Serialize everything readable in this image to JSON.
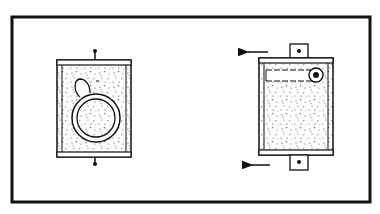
{
  "diagram": {
    "type": "technical-illustration",
    "colors": {
      "ink": "#111111",
      "paper": "#ffffff",
      "stipple": "#333333"
    },
    "frame": {
      "x": 12,
      "y": 17,
      "w": 358,
      "h": 185,
      "stroke": 3
    },
    "left_view": {
      "label": "",
      "body": {
        "x": 57,
        "y": 60,
        "w": 74,
        "h": 97
      },
      "rail_top": {
        "y": 60,
        "h": 5
      },
      "rail_bottom": {
        "y": 152,
        "h": 5
      },
      "pin_top": {
        "cx": 95,
        "cy": 51
      },
      "pin_bottom": {
        "cx": 95,
        "cy": 164
      },
      "dial": {
        "cx": 96,
        "cy": 118,
        "r_outer": 24,
        "r_inner": 19
      },
      "tab": {
        "cx": 81,
        "cy": 86
      }
    },
    "right_view": {
      "label": "",
      "body": {
        "x": 259,
        "y": 58,
        "w": 74,
        "h": 97
      },
      "rail_top": {
        "y": 58,
        "h": 5
      },
      "rail_bottom": {
        "y": 150,
        "h": 5
      },
      "lug_top": {
        "x": 290,
        "y": 44,
        "w": 18,
        "h": 14
      },
      "lug_bottom": {
        "x": 290,
        "y": 155,
        "w": 18,
        "h": 15
      },
      "slot": {
        "x": 266,
        "y": 70,
        "w": 55,
        "h": 11
      },
      "roller": {
        "cx": 316,
        "cy": 75,
        "r": 7
      },
      "arrows": [
        {
          "x1": 268,
          "y1": 52,
          "x2": 240,
          "y2": 52
        },
        {
          "x1": 270,
          "y1": 165,
          "x2": 244,
          "y2": 165
        }
      ]
    },
    "caption": ""
  }
}
